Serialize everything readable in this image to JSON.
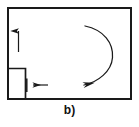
{
  "figure": {
    "caption": "b)",
    "stroke_color": "#1a1a1a",
    "background_color": "#ffffff",
    "outer_box": {
      "name": "enclosure-rectangle",
      "x": 7,
      "y": 7,
      "width": 124,
      "height": 92,
      "stroke_width": 2
    },
    "notch_box": {
      "name": "corner-notch-rectangle",
      "x": 7,
      "y": 68,
      "width": 18,
      "height": 31,
      "stroke_width": 1.6
    },
    "arrows": [
      {
        "name": "up-arrow",
        "direction": "up",
        "x1": 18.5,
        "y1": 52,
        "x2": 18.5,
        "y2": 30,
        "stroke_width": 1.2
      },
      {
        "name": "left-arrow",
        "direction": "left",
        "x1": 48,
        "y1": 85,
        "x2": 32,
        "y2": 85,
        "stroke_width": 1.2
      }
    ],
    "tick_mark": {
      "name": "vertical-tick-mark",
      "x": 26.5,
      "y1": 78,
      "y2": 92,
      "stroke_width": 1.4
    },
    "curved_arrow": {
      "name": "circulation-curved-arrow",
      "path": "M 85 26 C 104 30 113 44 112 58 C 111 72 99 82 83 84",
      "direction": "clockwise-ending-lower-left",
      "stroke_width": 1.2,
      "head_tip_x": 79,
      "head_tip_y": 86
    }
  }
}
